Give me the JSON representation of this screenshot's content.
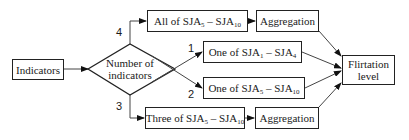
{
  "nodes": {
    "indicators": "Indicators",
    "decision": {
      "line1": "Number of",
      "line2": "indicators"
    },
    "all_of": {
      "prefix": "All of SJA",
      "s1": "5",
      "mid": " – SJA",
      "s2": "10"
    },
    "one_of_a": {
      "prefix": "One of SJA",
      "s1": "1",
      "mid": " – SJA",
      "s2": "4"
    },
    "one_of_b": {
      "prefix": "One of SJA",
      "s1": "5",
      "mid": " – SJA",
      "s2": "10"
    },
    "three_of": {
      "prefix": "Three of SJA",
      "s1": "5",
      "mid": " – SJA",
      "s2": "10"
    },
    "aggregation_top": "Aggregation",
    "aggregation_bottom": "Aggregation",
    "output": {
      "line1": "Flirtation",
      "line2": "level"
    }
  },
  "edge_labels": {
    "branch_4": "4",
    "branch_1": "1",
    "branch_2": "2",
    "branch_3": "3"
  }
}
